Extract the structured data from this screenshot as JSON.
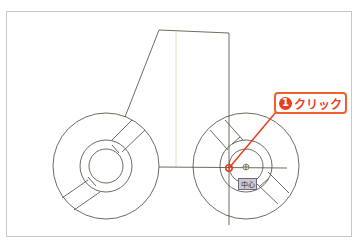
{
  "drawing": {
    "colors": {
      "line": "#4a4638",
      "guide": "#e6e2c8",
      "accent": "#e8401c",
      "callout_border": "#f0602a",
      "tooltip_bg": "#c9c9d4"
    },
    "wheels": [
      {
        "name": "left-wheel",
        "cx": 106,
        "cy": 166,
        "outer_r": 53,
        "middle_r": 26,
        "inner_r": 17
      },
      {
        "name": "right-wheel",
        "cx": 246,
        "cy": 166,
        "outer_r": 53,
        "middle_r": 26,
        "inner_r": 17
      }
    ]
  },
  "callout": {
    "step_number": "1",
    "label": "クリック"
  },
  "snap_tooltip": {
    "label": "中心"
  },
  "snap_marker": {
    "icon": "center-snap-icon"
  }
}
